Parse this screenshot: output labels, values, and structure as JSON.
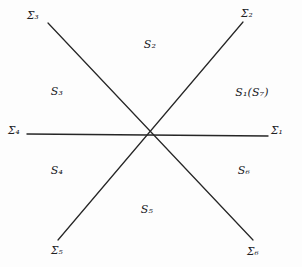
{
  "figure": {
    "background_color": "#fdfdfd",
    "line_color": "#262626",
    "text_color": "#20201f",
    "center": {
      "x": 152,
      "y": 135
    }
  },
  "axis_labels": [
    {
      "name": "sigma-1",
      "text": "Σ₁",
      "x": 277,
      "y": 130
    },
    {
      "name": "sigma-2",
      "text": "Σ₂",
      "x": 247,
      "y": 13
    },
    {
      "name": "sigma-3",
      "text": "Σ₃",
      "x": 33,
      "y": 15
    },
    {
      "name": "sigma-4",
      "text": "Σ₄",
      "x": 14,
      "y": 130
    },
    {
      "name": "sigma-5",
      "text": "Σ₅",
      "x": 57,
      "y": 250
    },
    {
      "name": "sigma-6",
      "text": "Σ₆",
      "x": 253,
      "y": 251
    }
  ],
  "region_labels": [
    {
      "name": "region-s1-s7",
      "text": "S₁(S₇)",
      "x": 252,
      "y": 92
    },
    {
      "name": "region-s2",
      "text": "S₂",
      "x": 150,
      "y": 44
    },
    {
      "name": "region-s3",
      "text": "S₃",
      "x": 57,
      "y": 91
    },
    {
      "name": "region-s4",
      "text": "S₄",
      "x": 57,
      "y": 170
    },
    {
      "name": "region-s5",
      "text": "S₅",
      "x": 147,
      "y": 209
    },
    {
      "name": "region-s6",
      "text": "S₆",
      "x": 244,
      "y": 170
    }
  ],
  "lines": [
    {
      "name": "line-sigma4-sigma1",
      "x1": 27,
      "y1": 134,
      "x2": 268,
      "y2": 136
    },
    {
      "name": "line-sigma3-sigma6",
      "x1": 48,
      "y1": 23,
      "x2": 253,
      "y2": 240
    },
    {
      "name": "line-sigma5-sigma2",
      "x1": 58,
      "y1": 240,
      "x2": 243,
      "y2": 22
    }
  ]
}
